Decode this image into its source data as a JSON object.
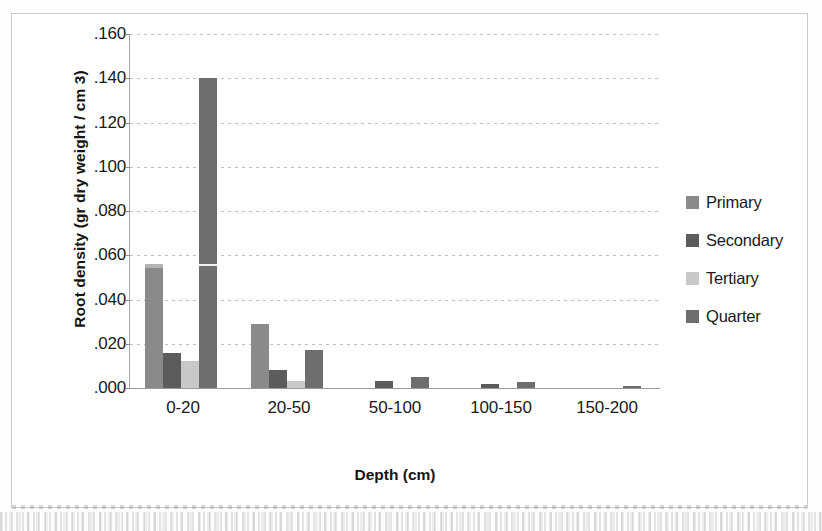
{
  "chart_data": {
    "type": "bar",
    "title": "",
    "xlabel": "Depth (cm)",
    "ylabel": "Root density (gr dry weight / cm 3)",
    "categories": [
      "0-20",
      "20-50",
      "50-100",
      "100-150",
      "150-200"
    ],
    "series": [
      {
        "name": "Primary",
        "color": "#8a8a8a",
        "values": [
          0.056,
          0.029,
          0.0,
          0.0,
          0.0
        ]
      },
      {
        "name": "Secondary",
        "color": "#5c5c5c",
        "values": [
          0.016,
          0.008,
          0.003,
          0.002,
          0.0
        ]
      },
      {
        "name": "Tertiary",
        "color": "#c8c8c8",
        "values": [
          0.012,
          0.003,
          0.0,
          0.0,
          0.0
        ]
      },
      {
        "name": "Quarter",
        "color": "#6e6e6e",
        "values": [
          0.14,
          0.017,
          0.005,
          0.0025,
          0.001
        ]
      }
    ],
    "ylim": [
      0.0,
      0.16
    ],
    "ytick_step": 0.02,
    "ytick_labels": [
      ".160",
      ".140",
      ".120",
      ".100",
      ".080",
      ".060",
      ".040",
      ".020",
      ".000"
    ],
    "ytick_values": [
      0.16,
      0.14,
      0.12,
      0.1,
      0.08,
      0.06,
      0.04,
      0.02,
      0.0
    ],
    "grid": true,
    "legend_position": "right",
    "legend_entries": [
      "Primary",
      "Secondary",
      "Tertiary",
      "Quarter"
    ]
  },
  "axes": {
    "y_title": "Root density (gr dry weight / cm 3)",
    "x_title": "Depth (cm)"
  },
  "legend": {
    "items": [
      {
        "label": "Primary",
        "color": "#8a8a8a"
      },
      {
        "label": "Secondary",
        "color": "#5c5c5c"
      },
      {
        "label": "Tertiary",
        "color": "#c8c8c8"
      },
      {
        "label": "Quarter",
        "color": "#6e6e6e"
      }
    ]
  }
}
